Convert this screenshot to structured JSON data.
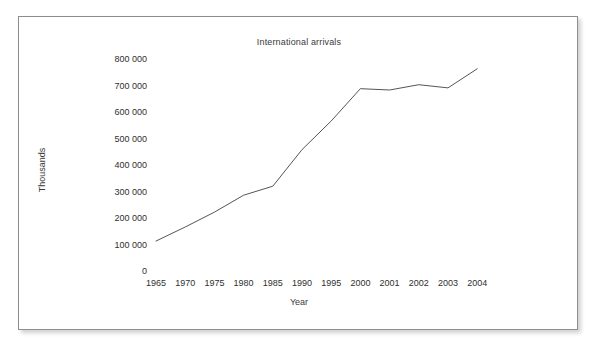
{
  "figure": {
    "title": "International arrivals",
    "frame_color": "#8d8d8d",
    "background": "#ffffff",
    "line_color": "#555555"
  },
  "chart_data": {
    "type": "line",
    "title": "International arrivals",
    "xlabel": "Year",
    "ylabel": "Thousands",
    "x": [
      "1965",
      "1970",
      "1975",
      "1980",
      "1985",
      "1990",
      "1995",
      "2000",
      "2001",
      "2002",
      "2003",
      "2004"
    ],
    "categories": [
      "1965",
      "1970",
      "1975",
      "1980",
      "1985",
      "1990",
      "1995",
      "2000",
      "2001",
      "2002",
      "2003",
      "2004"
    ],
    "values": [
      113000,
      166000,
      222000,
      286000,
      320000,
      458000,
      566000,
      688000,
      683000,
      703000,
      691000,
      763000
    ],
    "series": [
      {
        "name": "International arrivals",
        "values": [
          113000,
          166000,
          222000,
          286000,
          320000,
          458000,
          566000,
          688000,
          683000,
          703000,
          691000,
          763000
        ]
      }
    ],
    "ylim": [
      0,
      800000
    ],
    "ytick_values": [
      0,
      100000,
      200000,
      300000,
      400000,
      500000,
      600000,
      700000,
      800000
    ],
    "ytick_labels": [
      "0",
      "100 000",
      "200 000",
      "300 000",
      "400 000",
      "500 000",
      "600 000",
      "700 000",
      "800 000"
    ],
    "xtick_labels": [
      "1965",
      "1970",
      "1975",
      "1980",
      "1985",
      "1990",
      "1995",
      "2000",
      "2001",
      "2002",
      "2003",
      "2004"
    ],
    "grid": false,
    "legend": false,
    "legend_position": "none",
    "markers": false,
    "axis_lines": false
  },
  "axes": {
    "y": {
      "title": "Thousands",
      "labels": [
        "800 000",
        "700 000",
        "600 000",
        "500 000",
        "400 000",
        "300 000",
        "200 000",
        "100 000",
        "0"
      ]
    },
    "x": {
      "title": "Year",
      "labels": [
        "1965",
        "1970",
        "1975",
        "1980",
        "1985",
        "1990",
        "1995",
        "2000",
        "2001",
        "2002",
        "2003",
        "2004"
      ]
    }
  }
}
